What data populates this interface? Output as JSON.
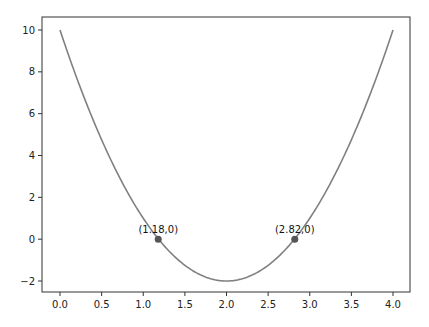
{
  "chart_data": {
    "type": "line",
    "title": "",
    "xlabel": "",
    "ylabel": "",
    "function": "y = 3x^2 - 12x + 10",
    "xlim": [
      -0.2,
      4.2
    ],
    "ylim": [
      -2.6,
      10.6
    ],
    "grid": false,
    "x_ticks": [
      "0.0",
      "0.5",
      "1.0",
      "1.5",
      "2.0",
      "2.5",
      "3.0",
      "3.5",
      "4.0"
    ],
    "y_ticks": [
      "−2",
      "0",
      "2",
      "4",
      "6",
      "8",
      "10"
    ],
    "series": [
      {
        "name": "curve",
        "color": "#808080",
        "x": [
          0,
          0.5,
          1,
          1.5,
          2,
          2.5,
          3,
          3.5,
          4
        ],
        "y": [
          10,
          4.75,
          1,
          -1.25,
          -2,
          -1.25,
          1,
          4.75,
          10
        ]
      }
    ],
    "points": [
      {
        "x": 1.18,
        "y": 0,
        "label": "(1.18,0)",
        "color": "#555555"
      },
      {
        "x": 2.82,
        "y": 0,
        "label": "(2.82,0)",
        "color": "#555555"
      }
    ]
  }
}
